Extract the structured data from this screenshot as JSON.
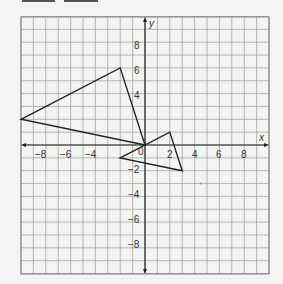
{
  "chart_data": {
    "type": "scatter",
    "title": "",
    "xlabel": "x",
    "ylabel": "y",
    "xlim": [
      -10,
      10
    ],
    "ylim": [
      -10,
      10
    ],
    "grid": true,
    "x_ticks": [
      "-8",
      "-6",
      "-4",
      "2",
      "4",
      "6",
      "8"
    ],
    "y_ticks": [
      "8",
      "6",
      "4",
      "-2",
      "-4",
      "-6",
      "-8"
    ],
    "origin_label": "0",
    "series": [
      {
        "name": "Triangle 1",
        "shape": "polygon",
        "points": [
          [
            -10,
            2
          ],
          [
            -2,
            6
          ],
          [
            0,
            0
          ]
        ]
      },
      {
        "name": "Triangle 2",
        "shape": "polygon",
        "points": [
          [
            -2,
            -1
          ],
          [
            2,
            1
          ],
          [
            3,
            -2
          ]
        ]
      }
    ],
    "annotations": [
      {
        "type": "dot",
        "x": 4.5,
        "y": -3
      }
    ]
  },
  "labels": {
    "x_axis": "x",
    "y_axis": "y",
    "origin": "0",
    "xt": {
      "m8": "−8",
      "m6": "−6",
      "m4": "−4",
      "p2": "2",
      "p4": "4",
      "p6": "6",
      "p8": "8"
    },
    "yt": {
      "p8": "8",
      "p6": "6",
      "p4": "4",
      "m2": "−2",
      "m4": "−4",
      "m6": "−6",
      "m8": "−8"
    }
  }
}
